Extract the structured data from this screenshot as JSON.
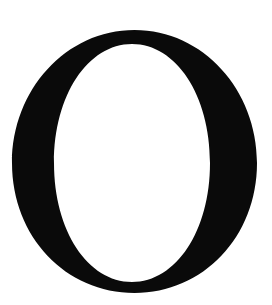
{
  "glyph": {
    "character": "O",
    "color": "#0a0a0a",
    "background": "#ffffff"
  }
}
